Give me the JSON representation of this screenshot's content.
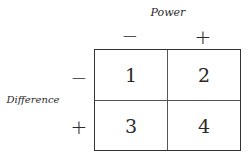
{
  "column_axis": {
    "title": "Power",
    "levels": [
      "−",
      "+"
    ]
  },
  "row_axis": {
    "title": "Difference",
    "levels": [
      "−",
      "+"
    ]
  },
  "cells": [
    [
      "1",
      "2"
    ],
    [
      "3",
      "4"
    ]
  ]
}
